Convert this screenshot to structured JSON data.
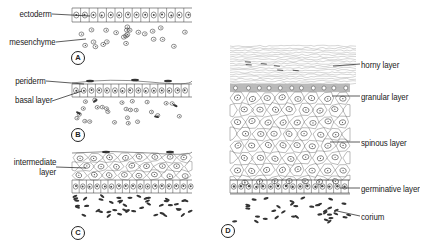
{
  "figure": {
    "panels": [
      {
        "id": "A",
        "labels": [
          {
            "text": "ectoderm"
          },
          {
            "text": "mesenchyme"
          }
        ]
      },
      {
        "id": "B",
        "labels": [
          {
            "text": "periderm"
          },
          {
            "text": "basal layer"
          }
        ]
      },
      {
        "id": "C",
        "labels": [
          {
            "text": "intermediate layer",
            "lines": [
              "intermediate",
              "layer"
            ]
          }
        ]
      },
      {
        "id": "D",
        "labels": [
          {
            "text": "horny layer"
          },
          {
            "text": "granular layer"
          },
          {
            "text": "spinous layer"
          },
          {
            "text": "germinative layer"
          },
          {
            "text": "corium"
          }
        ]
      }
    ]
  },
  "colors": {
    "ink": "#222222",
    "line": "#555555",
    "background": "#ffffff"
  }
}
